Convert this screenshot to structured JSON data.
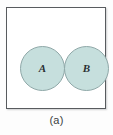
{
  "figure": {
    "caption": "(a)",
    "universal_set": {
      "name": "universal-set-rectangle",
      "border_color": "#585b5e",
      "fill_color": "#ffffff"
    },
    "sets": [
      {
        "id": "a",
        "label": "A",
        "shape": "circle",
        "fill_color": "#c6dfdd",
        "border_color": "#8fa8a8"
      },
      {
        "id": "b",
        "label": "B",
        "shape": "circle",
        "fill_color": "#c6dfdd",
        "border_color": "#8fa8a8"
      }
    ],
    "relationship": "disjoint",
    "background_color": "#fdfdfd"
  }
}
